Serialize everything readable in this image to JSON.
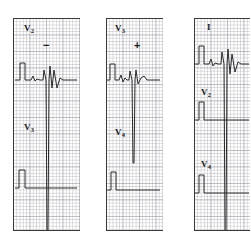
{
  "figure": {
    "background_color": "#ffffff",
    "trace_color": "#2b2b2b",
    "grid_color": "#96969f",
    "width": 251,
    "height": 247
  },
  "panels": [
    {
      "id": "panel-1",
      "x": 13,
      "y": 18,
      "width": 67,
      "height": 213,
      "bottom_border": true,
      "labels": [
        {
          "name": "lead-label-v2",
          "lead": "V",
          "subscript": "2",
          "x": 11,
          "y": 6
        },
        {
          "name": "lead-label-v3",
          "lead": "V",
          "subscript": "3",
          "x": 11,
          "y": 105
        }
      ],
      "signs": [
        {
          "name": "polarity-minus",
          "text": "−",
          "x": 30,
          "y": 22
        }
      ],
      "traces": [
        {
          "name": "ecg-trace-upper",
          "d": "M 2 62 L 7 62 L 7 45 L 12 45 L 12 62 L 18 62 L 20 58 L 22 63 L 24 61 L 27 62 L 30 62 L 31 52 L 33 62 L 34 213 L 35 213 L 36 62 L 37 48 L 39 70 L 41 52 L 44 70 L 47 60 L 50 62 L 58 62 L 64 62"
        }
      ],
      "calibration": {
        "name": "calibration-pulse-lower",
        "d": "M 2 170 L 6 170 L 6 152 L 12 152 L 12 170 L 64 170"
      }
    },
    {
      "id": "panel-2",
      "x": 106,
      "y": 18,
      "width": 57,
      "height": 213,
      "bottom_border": true,
      "labels": [
        {
          "name": "lead-label-v3",
          "lead": "V",
          "subscript": "3",
          "x": 9,
          "y": 6
        },
        {
          "name": "lead-label-v4",
          "lead": "V",
          "subscript": "4",
          "x": 9,
          "y": 110
        }
      ],
      "signs": [
        {
          "name": "polarity-plus",
          "text": "+",
          "x": 28,
          "y": 22
        }
      ],
      "traces": [
        {
          "name": "ecg-trace-upper",
          "d": "M 1 62 L 4 62 L 4 46 L 9 46 L 9 62 L 13 62 L 15 57 L 17 64 L 19 60 L 21 62 L 23 62 L 24 53 L 26 62 L 27 145 L 28 145 L 29 62 L 30 52 L 32 66 L 35 60 L 38 58 L 41 62 L 48 62 L 54 62"
        }
      ],
      "calibration": {
        "name": "calibration-pulse-lower",
        "d": "M 1 172 L 5 172 L 5 154 L 10 154 L 10 172 L 54 172"
      }
    },
    {
      "id": "panel-3",
      "x": 194,
      "y": 18,
      "width": 56,
      "height": 213,
      "bottom_border": true,
      "labels": [
        {
          "name": "lead-label-i",
          "lead": "I",
          "subscript": "",
          "x": 13,
          "y": 5
        },
        {
          "name": "lead-label-v2",
          "lead": "V",
          "subscript": "2",
          "x": 7,
          "y": 70
        },
        {
          "name": "lead-label-v4",
          "lead": "V",
          "subscript": "4",
          "x": 7,
          "y": 142
        }
      ],
      "signs": [],
      "traces": [
        {
          "name": "ecg-trace-upper",
          "d": "M 1 46 L 5 46 L 5 28 L 10 28 L 10 46 L 15 46 L 17 41 L 19 48 L 21 45 L 24 46 L 27 46 L 28 34 L 30 46 L 31 213 L 32 213 L 33 46 L 34 31 L 36 56 L 38 36 L 41 54 L 44 44 L 47 46 L 52 46 L 55 46"
        }
      ],
      "calibration": {
        "name": "calibration-pulse-middle",
        "d": "M 1 102 L 5 102 L 5 84 L 10 84 L 10 102 L 55 102"
      },
      "calibration2": {
        "name": "calibration-pulse-lower",
        "d": "M 1 175 L 5 175 L 5 157 L 10 157 L 10 175 L 55 175"
      }
    }
  ]
}
